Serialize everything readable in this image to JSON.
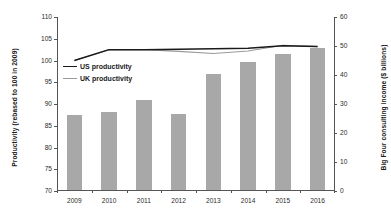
{
  "chart_data": {
    "type": "bar",
    "title": "",
    "subtitle": "",
    "xlabel": "",
    "categories": [
      "2009",
      "2010",
      "2011",
      "2012",
      "2013",
      "2014",
      "2015",
      "2016"
    ],
    "grid": false,
    "legend_position": "inside-top-left",
    "left_axis": {
      "label": "Productivity (rebased to 100 in 2009)",
      "ylim": [
        70,
        110
      ],
      "ticks": [
        "110",
        "105",
        "100",
        "95",
        "90",
        "85",
        "80",
        "75",
        "70"
      ],
      "tick_values": [
        110,
        105,
        100,
        95,
        90,
        85,
        80,
        75,
        70
      ]
    },
    "right_axis": {
      "label": "Big Four consulting income ($ billions)",
      "ylim": [
        0,
        60
      ],
      "ticks": [
        "60",
        "50",
        "40",
        "30",
        "20",
        "10",
        "0"
      ],
      "tick_values": [
        60,
        50,
        40,
        30,
        20,
        10,
        0
      ]
    },
    "bars": {
      "name": "Big Four consulting income ($ billions)",
      "axis": "right",
      "color": "#a8a8a8",
      "values": [
        26.0,
        27.0,
        31.0,
        26.2,
        40.0,
        44.0,
        47.0,
        49.0
      ]
    },
    "series": [
      {
        "name": "US productivity",
        "axis": "left",
        "color": "#1a1a1a",
        "style": "solid",
        "values": [
          100.0,
          102.5,
          102.5,
          102.6,
          102.7,
          102.8,
          103.4,
          103.2
        ]
      },
      {
        "name": "UK productivity",
        "axis": "left",
        "color": "#9a9a9a",
        "style": "solid",
        "values": [
          100.0,
          102.5,
          102.5,
          102.1,
          101.6,
          102.2,
          103.5,
          103.2
        ]
      }
    ]
  },
  "legend": {
    "items": [
      {
        "label": "US productivity",
        "color": "#1a1a1a"
      },
      {
        "label": "UK productivity",
        "color": "#9a9a9a"
      }
    ]
  }
}
